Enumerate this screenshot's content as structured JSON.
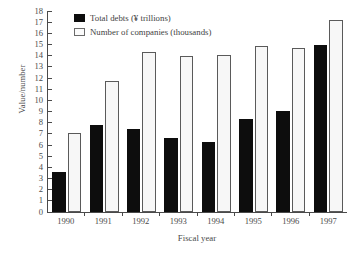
{
  "chart_data": {
    "type": "bar",
    "title": "",
    "xlabel": "Fiscal year",
    "ylabel": "Value/number",
    "categories": [
      "1990",
      "1991",
      "1992",
      "1993",
      "1994",
      "1995",
      "1996",
      "1997"
    ],
    "series": [
      {
        "name": "Total debts (¥ trillions)",
        "color": "#0d0d0d",
        "values": [
          3.6,
          7.8,
          7.4,
          6.6,
          6.3,
          8.35,
          9.05,
          15.0
        ]
      },
      {
        "name": "Number of companies (thousands)",
        "color": "#f7f7f7",
        "values": [
          7.1,
          11.7,
          14.35,
          13.95,
          14.05,
          14.85,
          14.7,
          17.2
        ]
      }
    ],
    "ylim": [
      0,
      18
    ],
    "yticks": [
      "0",
      "1",
      "2",
      "3",
      "4",
      "5",
      "6",
      "7",
      "8",
      "9",
      "10",
      "11",
      "12",
      "13",
      "14",
      "15",
      "16",
      "17",
      "18"
    ],
    "grid": false,
    "legend_position": "top-center"
  },
  "legend": {
    "entries": [
      {
        "label": "Total debts (¥ trillions)",
        "swatch": "black-filled-square"
      },
      {
        "label": "Number of companies (thousands)",
        "swatch": "white-outlined-square"
      }
    ]
  },
  "axes": {
    "y_title": "Value/number",
    "x_title": "Fiscal year"
  }
}
